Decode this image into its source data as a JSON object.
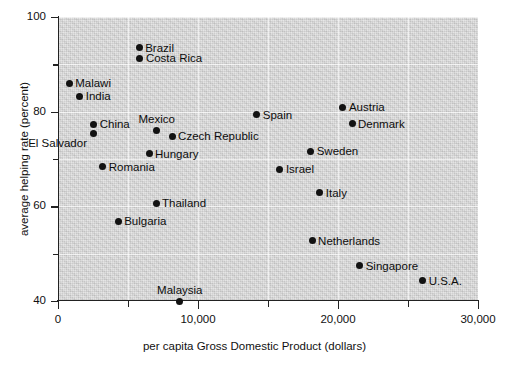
{
  "chart_data": {
    "type": "scatter",
    "title": "",
    "xlabel": "per capita Gross Domestic Product (dollars)",
    "ylabel": "average helping rate (percent)",
    "xlim": [
      0,
      30000
    ],
    "ylim": [
      40,
      100
    ],
    "xticks": [
      "0",
      "10,000",
      "20,000",
      "30,000"
    ],
    "xtick_values": [
      0,
      10000,
      20000,
      30000
    ],
    "xminor_values": [
      5000,
      15000,
      25000
    ],
    "yticks": [
      "40",
      "60",
      "80",
      "100"
    ],
    "ytick_values": [
      40,
      60,
      80,
      100
    ],
    "yminor_values": [
      50,
      70,
      90
    ],
    "grid": true,
    "legend": "none",
    "points": [
      {
        "label": "Brazil",
        "x": 5800,
        "y": 93.5,
        "side": "right"
      },
      {
        "label": "Costa Rica",
        "x": 5850,
        "y": 91.3,
        "side": "right"
      },
      {
        "label": "Malawi",
        "x": 800,
        "y": 86.0,
        "side": "right"
      },
      {
        "label": "India",
        "x": 1550,
        "y": 83.3,
        "side": "right"
      },
      {
        "label": "China",
        "x": 2550,
        "y": 77.3,
        "side": "right"
      },
      {
        "label": "El Salvador",
        "x": 2500,
        "y": 75.4,
        "side": "left"
      },
      {
        "label": "Mexico",
        "x": 7050,
        "y": 76.1,
        "side": "above"
      },
      {
        "label": "Czech Republic",
        "x": 8150,
        "y": 74.8,
        "side": "right"
      },
      {
        "label": "Hungary",
        "x": 6500,
        "y": 71.1,
        "side": "right"
      },
      {
        "label": "Romania",
        "x": 3200,
        "y": 68.4,
        "side": "right"
      },
      {
        "label": "Spain",
        "x": 14200,
        "y": 79.4,
        "side": "right"
      },
      {
        "label": "Austria",
        "x": 20350,
        "y": 80.9,
        "side": "right"
      },
      {
        "label": "Denmark",
        "x": 21000,
        "y": 77.5,
        "side": "right"
      },
      {
        "label": "Sweden",
        "x": 18050,
        "y": 71.6,
        "side": "right"
      },
      {
        "label": "Israel",
        "x": 15850,
        "y": 67.8,
        "side": "right"
      },
      {
        "label": "Italy",
        "x": 18700,
        "y": 62.9,
        "side": "right"
      },
      {
        "label": "Thailand",
        "x": 7000,
        "y": 60.6,
        "side": "right"
      },
      {
        "label": "Bulgaria",
        "x": 4300,
        "y": 56.8,
        "side": "right"
      },
      {
        "label": "Netherlands",
        "x": 18150,
        "y": 52.7,
        "side": "right"
      },
      {
        "label": "Singapore",
        "x": 21550,
        "y": 47.4,
        "side": "right"
      },
      {
        "label": "U.S.A.",
        "x": 26050,
        "y": 44.3,
        "side": "right"
      },
      {
        "label": "Malaysia",
        "x": 8700,
        "y": 40.0,
        "side": "above"
      }
    ]
  },
  "colors": {
    "plot_background": "#d7d7d7",
    "point": "#121212",
    "axis": "#222222",
    "gridline": "#ffffff",
    "text": "#111111"
  }
}
